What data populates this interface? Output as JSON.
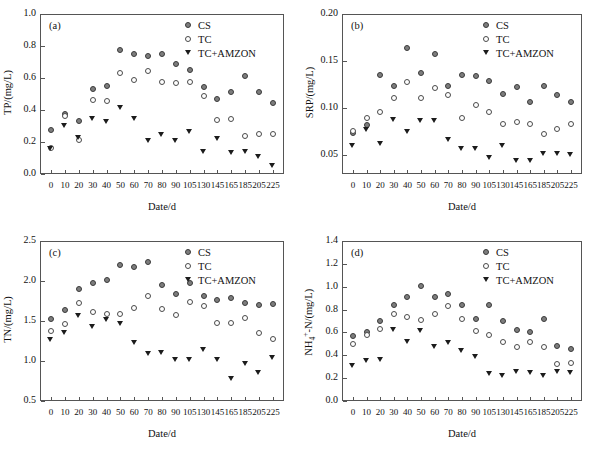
{
  "figure": {
    "xlabel": "Date/d",
    "legend_entries": [
      {
        "key": "CS",
        "label": "CS",
        "marker": "filled-circle-icon",
        "color": "#7d7d7d"
      },
      {
        "key": "TC",
        "label": "TC",
        "marker": "open-circle-icon",
        "color": "#ffffff"
      },
      {
        "key": "TC+AMZON",
        "label": "TC+AMZON",
        "marker": "filled-triangle-down-icon",
        "color": "#1c1c1c"
      }
    ],
    "categories": [
      0,
      10,
      20,
      30,
      40,
      50,
      60,
      70,
      80,
      90,
      105,
      130,
      145,
      165,
      185,
      205,
      225
    ],
    "category_labels": [
      "0",
      "10",
      "20",
      "30",
      "40",
      "50",
      "60",
      "70",
      "80",
      "90",
      "105",
      "130",
      "145",
      "165",
      "185",
      "205",
      "225"
    ]
  },
  "panels": {
    "a": {
      "tag": "(a)",
      "ylabel": "TP/(mg/L)",
      "xlabel": "Date/d",
      "yticks": [
        "0.0",
        "0.2",
        "0.4",
        "0.6",
        "0.8",
        "1.0"
      ]
    },
    "b": {
      "tag": "(b)",
      "ylabel": "SRP/(mg/L)",
      "xlabel": "Date/d",
      "yticks": [
        "0.05",
        "0.10",
        "0.15",
        "0.20"
      ]
    },
    "c": {
      "tag": "(c)",
      "ylabel": "TN/(mg/L)",
      "xlabel": "Date/d",
      "yticks": [
        "0.5",
        "1.0",
        "1.5",
        "2.0",
        "2.5"
      ]
    },
    "d": {
      "tag": "(d)",
      "ylabel_html": "NH<sub>4</sub><sup>+</sup>-N/(mg/L)",
      "ylabel": "NH4+-N/(mg/L)",
      "xlabel": "Date/d",
      "yticks": [
        "0.0",
        "0.2",
        "0.4",
        "0.6",
        "0.8",
        "1.0",
        "1.2",
        "1.4"
      ]
    }
  },
  "chart_data": [
    {
      "panel": "a",
      "type": "scatter",
      "title": "(a)",
      "xlabel": "Date/d",
      "ylabel": "TP/(mg/L)",
      "x": [
        0,
        10,
        20,
        30,
        40,
        50,
        60,
        70,
        80,
        90,
        105,
        130,
        145,
        165,
        185,
        205,
        225
      ],
      "ylim": [
        0.0,
        1.0
      ],
      "yticks": [
        0.0,
        0.2,
        0.4,
        0.6,
        0.8,
        1.0
      ],
      "grid": false,
      "legend_position": "top-right",
      "series": [
        {
          "name": "CS",
          "values": [
            0.275,
            0.375,
            0.33,
            0.53,
            0.55,
            0.775,
            0.75,
            0.735,
            0.75,
            0.69,
            0.65,
            0.545,
            0.47,
            0.515,
            0.61,
            0.515,
            0.445
          ]
        },
        {
          "name": "TC",
          "values": [
            0.165,
            0.365,
            0.21,
            0.465,
            0.455,
            0.63,
            0.585,
            0.645,
            0.575,
            0.57,
            0.575,
            0.485,
            0.335,
            0.345,
            0.235,
            0.25,
            0.25
          ]
        },
        {
          "name": "TC+AMZON",
          "values": [
            0.155,
            0.3,
            0.225,
            0.345,
            0.325,
            0.415,
            0.345,
            0.205,
            0.245,
            0.205,
            0.265,
            0.14,
            0.22,
            0.135,
            0.14,
            0.11,
            0.05
          ]
        }
      ]
    },
    {
      "panel": "b",
      "type": "scatter",
      "title": "(b)",
      "xlabel": "Date/d",
      "ylabel": "SRP/(mg/L)",
      "x": [
        0,
        10,
        20,
        30,
        40,
        50,
        60,
        70,
        80,
        90,
        105,
        130,
        145,
        165,
        185,
        205,
        225
      ],
      "ylim": [
        0.03,
        0.2
      ],
      "yticks": [
        0.05,
        0.1,
        0.15,
        0.2
      ],
      "grid": false,
      "legend_position": "top-right",
      "series": [
        {
          "name": "CS",
          "values": [
            0.074,
            0.082,
            0.135,
            0.124,
            0.164,
            0.137,
            0.158,
            0.124,
            0.135,
            0.134,
            0.129,
            0.115,
            0.122,
            0.106,
            0.124,
            0.114,
            0.106
          ]
        },
        {
          "name": "TC",
          "values": [
            0.076,
            0.09,
            0.096,
            0.111,
            0.128,
            0.111,
            0.121,
            0.114,
            0.089,
            0.103,
            0.096,
            0.083,
            0.085,
            0.083,
            0.072,
            0.078,
            0.083
          ]
        },
        {
          "name": "TC+AMZON",
          "values": [
            0.06,
            0.077,
            0.062,
            0.088,
            0.075,
            0.086,
            0.086,
            0.066,
            0.057,
            0.057,
            0.047,
            0.06,
            0.044,
            0.044,
            0.051,
            0.051,
            0.05
          ]
        }
      ]
    },
    {
      "panel": "c",
      "type": "scatter",
      "title": "(c)",
      "xlabel": "Date/d",
      "ylabel": "TN/(mg/L)",
      "x": [
        0,
        10,
        20,
        30,
        40,
        50,
        60,
        70,
        80,
        90,
        105,
        130,
        145,
        165,
        185,
        205,
        225
      ],
      "ylim": [
        0.5,
        2.5
      ],
      "yticks": [
        0.5,
        1.0,
        1.5,
        2.0,
        2.5
      ],
      "grid": false,
      "legend_position": "top-right",
      "series": [
        {
          "name": "CS",
          "values": [
            1.52,
            1.64,
            1.9,
            1.97,
            2.01,
            2.2,
            2.18,
            2.24,
            1.95,
            1.84,
            1.97,
            1.81,
            1.76,
            1.79,
            1.72,
            1.7,
            1.71
          ]
        },
        {
          "name": "TC",
          "values": [
            1.37,
            1.46,
            1.73,
            1.61,
            1.59,
            1.59,
            1.66,
            1.81,
            1.65,
            1.57,
            1.74,
            1.69,
            1.47,
            1.47,
            1.54,
            1.35,
            1.27
          ]
        },
        {
          "name": "TC+AMZON",
          "values": [
            1.27,
            1.35,
            1.57,
            1.43,
            1.51,
            1.47,
            1.23,
            1.09,
            1.1,
            1.02,
            1.02,
            1.14,
            1.01,
            0.78,
            0.96,
            0.85,
            1.04
          ]
        }
      ]
    },
    {
      "panel": "d",
      "type": "scatter",
      "title": "(d)",
      "xlabel": "Date/d",
      "ylabel": "NH4+-N/(mg/L)",
      "x": [
        0,
        10,
        20,
        30,
        40,
        50,
        60,
        70,
        80,
        90,
        105,
        130,
        145,
        165,
        185,
        205,
        225
      ],
      "ylim": [
        0.0,
        1.4
      ],
      "yticks": [
        0.0,
        0.2,
        0.4,
        0.6,
        0.8,
        1.0,
        1.2,
        1.4
      ],
      "grid": false,
      "legend_position": "top-right",
      "series": [
        {
          "name": "CS",
          "values": [
            0.565,
            0.605,
            0.7,
            0.84,
            0.91,
            1.01,
            0.91,
            0.935,
            0.84,
            0.715,
            0.84,
            0.7,
            0.625,
            0.605,
            0.72,
            0.48,
            0.455
          ]
        },
        {
          "name": "TC",
          "values": [
            0.5,
            0.575,
            0.63,
            0.765,
            0.735,
            0.705,
            0.765,
            0.835,
            0.715,
            0.615,
            0.575,
            0.515,
            0.475,
            0.515,
            0.475,
            0.32,
            0.33
          ]
        },
        {
          "name": "TC+AMZON",
          "values": [
            0.305,
            0.355,
            0.36,
            0.62,
            0.515,
            0.61,
            0.47,
            0.51,
            0.435,
            0.39,
            0.24,
            0.22,
            0.255,
            0.245,
            0.22,
            0.255,
            0.25
          ]
        }
      ]
    }
  ]
}
